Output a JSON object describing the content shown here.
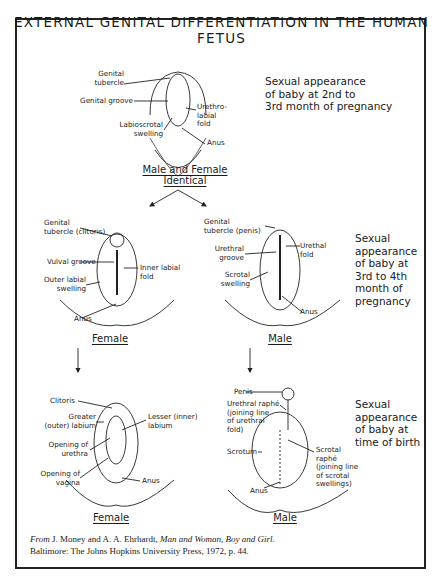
{
  "title": "EXTERNAL GENITAL DIFFERENTIATION IN THE HUMAN FETUS",
  "panels": {
    "top": {
      "heading": "Male and Female Identical",
      "caption": "Sexual appearance\nof baby at 2nd to\n3rd month of pregnancy",
      "labels": [
        "Genital\ntubercle",
        "Genital groove",
        "Labioscrotal\nswelling",
        "Urethro-\nlabial\nfold",
        "Anus"
      ]
    },
    "middle_female": {
      "heading": "Female",
      "labels": [
        "Genital\ntubercle (clitoris)",
        "Vulval groove",
        "Outer labial\nswelling",
        "Inner labial\nfold",
        "Anus"
      ]
    },
    "middle_male": {
      "heading": "Male",
      "labels": [
        "Genital\ntubercle (penis)",
        "Urethral\ngroove",
        "Scrotal\nswelling",
        "Urethal\nfold",
        "Anus"
      ]
    },
    "middle_caption": "Sexual\nappearance\nof baby at\n3rd to 4th\nmonth of\npregnancy",
    "bottom_female": {
      "heading": "Female",
      "labels": [
        "Clitoris",
        "Greater\n(outer) labium",
        "Opening of\nurethra",
        "Opening of\nvagina",
        "Lesser (inner)\nlabium",
        "Anus"
      ]
    },
    "bottom_male": {
      "heading": "Male",
      "labels": [
        "Penis",
        "Urethral raphé\n(joining line\nof urethral\nfold)",
        "Scrotum",
        "Scrotal\nraphé\n(joining line\nof scrotal\nswellings)",
        "Anus"
      ]
    },
    "bottom_caption": "Sexual\nappearance\nof baby at\ntime of birth"
  },
  "citation": {
    "prefix": "From",
    "authors": "J. Money and A. A. Ehrhardt,",
    "book": "Man and Woman, Boy and Girl.",
    "publisher": "Baltimore: The Johns Hopkins University Press, 1972, p. 44."
  }
}
